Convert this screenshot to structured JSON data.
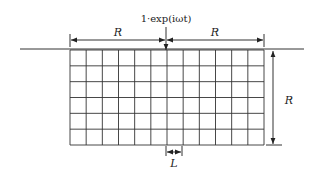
{
  "diagram": {
    "source_label": "1·exp(iωt)",
    "half_width_label_left": "R",
    "half_width_label_right": "R",
    "depth_label": "R",
    "cell_size_label": "L",
    "grid": {
      "x0": 70,
      "y0": 50,
      "x1": 264,
      "y1": 145,
      "columns": 12,
      "rows": 6
    },
    "ground_line": {
      "x0": 20,
      "x1": 304,
      "y": 49
    },
    "colors": {
      "line": "#333333",
      "text": "#222222",
      "background": "#ffffff"
    }
  }
}
